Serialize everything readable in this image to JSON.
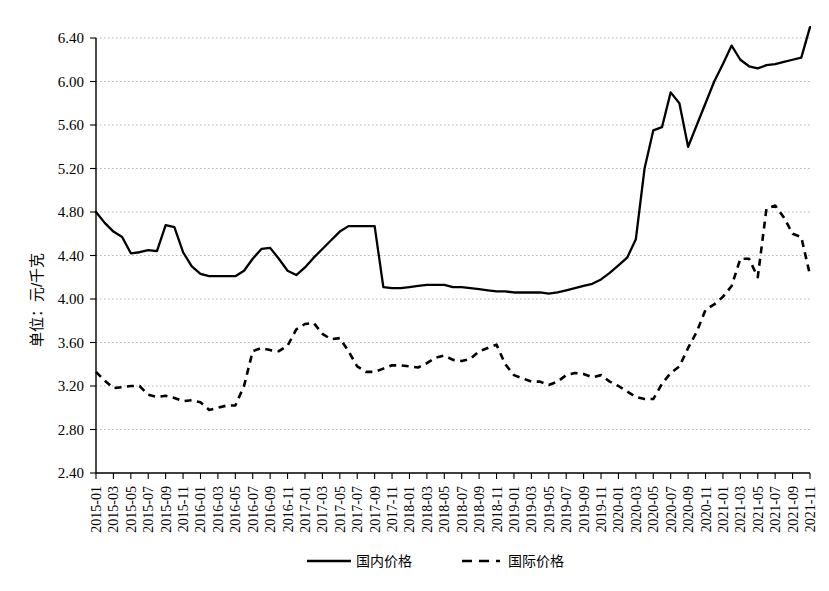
{
  "chart_data": {
    "type": "line",
    "title": "",
    "xlabel": "",
    "ylabel": "单位：元/千克",
    "ylim": [
      2.4,
      6.4
    ],
    "ytick_labels": [
      "6.40",
      "6.00",
      "5.60",
      "5.20",
      "4.80",
      "4.40",
      "4.00",
      "3.60",
      "3.20",
      "2.80",
      "2.40"
    ],
    "ytick_values": [
      6.4,
      6.0,
      5.6,
      5.2,
      4.8,
      4.4,
      4.0,
      3.6,
      3.2,
      2.8,
      2.4
    ],
    "grid": true,
    "legend_position": "bottom",
    "x": [
      "2015-01",
      "2015-02",
      "2015-03",
      "2015-04",
      "2015-05",
      "2015-06",
      "2015-07",
      "2015-08",
      "2015-09",
      "2015-10",
      "2015-11",
      "2015-12",
      "2016-01",
      "2016-02",
      "2016-03",
      "2016-04",
      "2016-05",
      "2016-06",
      "2016-07",
      "2016-08",
      "2016-09",
      "2016-10",
      "2016-11",
      "2016-12",
      "2017-01",
      "2017-02",
      "2017-03",
      "2017-04",
      "2017-05",
      "2017-06",
      "2017-07",
      "2017-08",
      "2017-09",
      "2017-10",
      "2017-11",
      "2017-12",
      "2018-01",
      "2018-02",
      "2018-03",
      "2018-04",
      "2018-05",
      "2018-06",
      "2018-07",
      "2018-08",
      "2018-09",
      "2018-10",
      "2018-11",
      "2018-12",
      "2019-01",
      "2019-02",
      "2019-03",
      "2019-04",
      "2019-05",
      "2019-06",
      "2019-07",
      "2019-08",
      "2019-09",
      "2019-10",
      "2019-11",
      "2019-12",
      "2020-01",
      "2020-02",
      "2020-03",
      "2020-04",
      "2020-05",
      "2020-06",
      "2020-07",
      "2020-08",
      "2020-09",
      "2020-10",
      "2020-11",
      "2020-12",
      "2021-01",
      "2021-02",
      "2021-03",
      "2021-04",
      "2021-05",
      "2021-06",
      "2021-07",
      "2021-08",
      "2021-09",
      "2021-10",
      "2021-11"
    ],
    "xtick_labels": [
      "2015-01",
      "2015-03",
      "2015-05",
      "2015-07",
      "2015-09",
      "2015-11",
      "2016-01",
      "2016-03",
      "2016-05",
      "2016-07",
      "2016-09",
      "2016-11",
      "2017-01",
      "2017-03",
      "2017-05",
      "2017-07",
      "2017-09",
      "2017-11",
      "2018-01",
      "2018-03",
      "2018-05",
      "2018-07",
      "2018-09",
      "2018-11",
      "2019-01",
      "2019-03",
      "2019-05",
      "2019-07",
      "2019-09",
      "2019-11",
      "2020-01",
      "2020-03",
      "2020-05",
      "2020-07",
      "2020-09",
      "2020-11",
      "2021-01",
      "2021-03",
      "2021-05",
      "2021-07",
      "2021-09",
      "2021-11"
    ],
    "series": [
      {
        "name": "国内价格",
        "style": "solid",
        "color": "#000000",
        "values": [
          4.8,
          4.7,
          4.62,
          4.57,
          4.42,
          4.43,
          4.45,
          4.44,
          4.68,
          4.66,
          4.43,
          4.3,
          4.23,
          4.21,
          4.21,
          4.21,
          4.21,
          4.26,
          4.37,
          4.46,
          4.47,
          4.37,
          4.26,
          4.22,
          4.29,
          4.38,
          4.46,
          4.54,
          4.62,
          4.67,
          4.67,
          4.67,
          4.67,
          4.11,
          4.1,
          4.1,
          4.11,
          4.12,
          4.13,
          4.13,
          4.13,
          4.11,
          4.11,
          4.1,
          4.09,
          4.08,
          4.07,
          4.07,
          4.06,
          4.06,
          4.06,
          4.06,
          4.05,
          4.06,
          4.08,
          4.1,
          4.12,
          4.14,
          4.18,
          4.24,
          4.31,
          4.38,
          4.55,
          5.2,
          5.55,
          5.58,
          5.9,
          5.8,
          5.4,
          5.6,
          5.8,
          6.0,
          6.16,
          6.33,
          6.2,
          6.14,
          6.12,
          6.15,
          6.16,
          6.18,
          6.2,
          6.22,
          6.5
        ]
      },
      {
        "name": "国际价格",
        "style": "dashed",
        "color": "#000000",
        "values": [
          3.33,
          3.25,
          3.18,
          3.19,
          3.2,
          3.2,
          3.12,
          3.1,
          3.11,
          3.09,
          3.06,
          3.07,
          3.05,
          2.98,
          3.0,
          3.02,
          3.02,
          3.2,
          3.52,
          3.55,
          3.53,
          3.52,
          3.57,
          3.72,
          3.77,
          3.78,
          3.68,
          3.63,
          3.64,
          3.52,
          3.38,
          3.33,
          3.33,
          3.36,
          3.39,
          3.39,
          3.38,
          3.37,
          3.41,
          3.46,
          3.48,
          3.44,
          3.43,
          3.45,
          3.52,
          3.55,
          3.58,
          3.4,
          3.3,
          3.27,
          3.24,
          3.24,
          3.21,
          3.24,
          3.3,
          3.32,
          3.31,
          3.28,
          3.3,
          3.24,
          3.2,
          3.15,
          3.1,
          3.08,
          3.08,
          3.22,
          3.32,
          3.38,
          3.55,
          3.7,
          3.9,
          3.95,
          4.02,
          4.12,
          4.37,
          4.37,
          4.2,
          4.83,
          4.86,
          4.75,
          4.6,
          4.57,
          4.22
        ]
      }
    ]
  },
  "legend": {
    "items": [
      {
        "label": "国内价格",
        "style": "solid"
      },
      {
        "label": "国际价格",
        "style": "dashed"
      }
    ]
  },
  "axis": {
    "ylabel": "单位：元/千克"
  }
}
